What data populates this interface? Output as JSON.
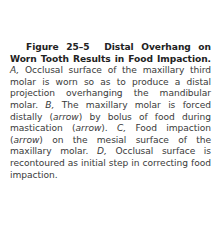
{
  "figure": {
    "label": "Figure 25–5",
    "title": "Distal Overhang on Worn Tooth Results in Food Impaction.",
    "parts": [
      {
        "marker": "A,",
        "text": "Occlusal surface of the maxillary third molar is worn so as to produce a distal projection overhanging the mandibular molar."
      },
      {
        "marker": "B,",
        "text_before": "The maxillary molar is forced distally",
        "arrow1": "arrow",
        "text_mid": "by bolus of food during mastication",
        "arrow2": "arrow",
        "text_end": "."
      },
      {
        "marker": "C,",
        "text_before": "Food impaction",
        "arrow": "arrow",
        "text_after": "on the mesial surface of the maxillary molar."
      },
      {
        "marker": "D,",
        "text": "Occlusal surface is recontoured as initial step in correcting food impaction."
      }
    ]
  }
}
